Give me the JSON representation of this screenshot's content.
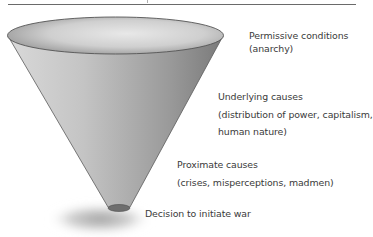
{
  "figure": {
    "type": "funnel-cone",
    "colors": {
      "rule": "#6a6a6a",
      "text": "#3a3a3a",
      "cone_light": "#e2e2e2",
      "cone_dark": "#7e7e7e",
      "cone_outline": "#555555",
      "shadow": "#9a9a9a"
    },
    "levels": [
      {
        "title": "Permissive conditions",
        "detail": "(anarchy)"
      },
      {
        "title": "Underlying causes",
        "detail_line1": "(distribution of power, capitalism,",
        "detail_line2": "human nature)"
      },
      {
        "title": "Proximate causes",
        "detail": "(crises, misperceptions, madmen)"
      },
      {
        "title": "Decision to initiate war"
      }
    ]
  }
}
